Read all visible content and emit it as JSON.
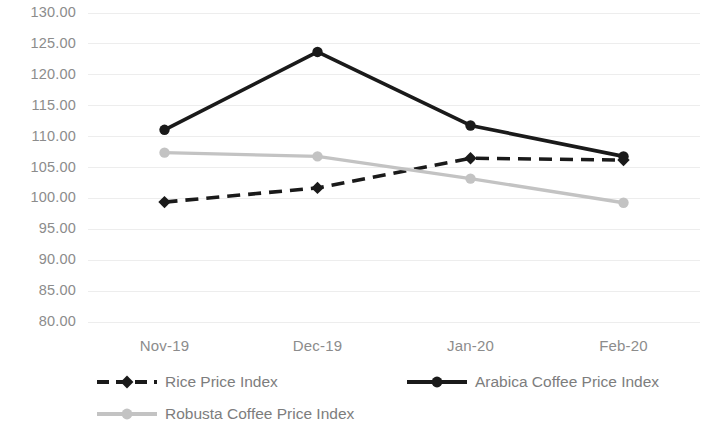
{
  "chart_data": {
    "type": "line",
    "title": "",
    "subtitle": "",
    "xlabel": "",
    "ylabel": "",
    "categories": [
      "Nov-19",
      "Dec-19",
      "Jan-20",
      "Feb-20"
    ],
    "ylim": [
      80,
      130
    ],
    "ytick_step": 5,
    "ytick_labels": [
      "130.00",
      "125.00",
      "120.00",
      "115.00",
      "110.00",
      "105.00",
      "100.00",
      "95.00",
      "90.00",
      "85.00",
      "80.00"
    ],
    "ytick_values": [
      130,
      125,
      120,
      115,
      110,
      105,
      100,
      95,
      90,
      85,
      80
    ],
    "grid": "horizontal",
    "legend_position": "bottom",
    "series": [
      {
        "name": "Rice Price Index",
        "values": [
          99.4,
          101.7,
          106.5,
          106.2
        ],
        "color": "#1a1a1a",
        "style": "dashed",
        "marker": "diamond"
      },
      {
        "name": "Arabica Coffee Price Index",
        "values": [
          111.1,
          123.7,
          111.8,
          106.8
        ],
        "color": "#1a1a1a",
        "style": "solid",
        "marker": "circle"
      },
      {
        "name": "Robusta Coffee Price Index",
        "values": [
          107.4,
          106.8,
          103.2,
          99.3
        ],
        "color": "#c3c3c3",
        "style": "solid",
        "marker": "circle"
      }
    ]
  },
  "legend": {
    "items": [
      {
        "label": "Rice Price Index"
      },
      {
        "label": "Arabica Coffee Price Index"
      },
      {
        "label": "Robusta Coffee Price Index"
      }
    ]
  },
  "colors": {
    "axis_text": "#8c8c8c",
    "gridline": "#ededed",
    "dark_series": "#1a1a1a",
    "light_series": "#c3c3c3",
    "background": "#ffffff"
  }
}
